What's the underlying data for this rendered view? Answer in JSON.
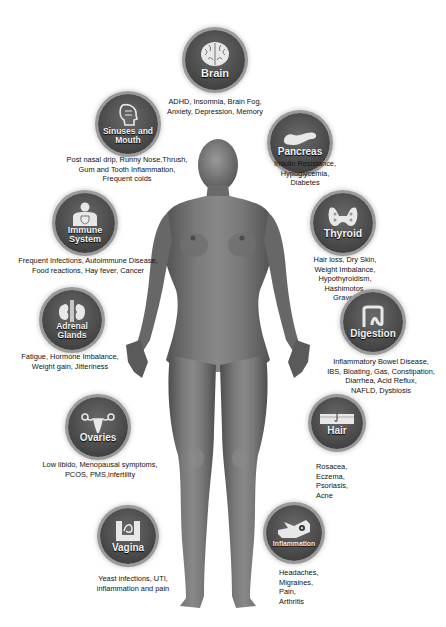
{
  "title": "",
  "colors": {
    "badge_fill": "#4a4a4a",
    "badge_ring": "#9a9a9a",
    "body_tone": "#6e6e6e",
    "text": "#111111",
    "background": "#ffffff"
  },
  "organs": [
    {
      "id": "brain",
      "label": "Brain",
      "icon": "brain-icon",
      "description": "ADHD, Insomnia, Brain Fog, Anxiety, Depression, Memory"
    },
    {
      "id": "sinuses",
      "label": "Sinuses and Mouth",
      "icon": "head-profile-icon",
      "description": "Post nasal drip, Runny Nose,Thrush, Gum and Tooth Inflammation, Frequent colds"
    },
    {
      "id": "pancreas",
      "label": "Pancreas",
      "icon": "pancreas-icon",
      "description": "Insulin Resistance, Hypoglycemia, Diabetes"
    },
    {
      "id": "immune",
      "label": "Immune System",
      "icon": "shield-torso-icon",
      "description": "Frequent Infections, Autoimmune Disease, Food reactions, Hay fever, Cancer"
    },
    {
      "id": "thyroid",
      "label": "Thyroid",
      "icon": "thyroid-icon",
      "description": "Hair loss, Dry Skin, Weight Imbalance, Hypothyroidism, Hashimotos, Graves"
    },
    {
      "id": "adrenal",
      "label": "Adrenal Glands",
      "icon": "kidneys-icon",
      "description": "Fatigue, Hormone Imbalance, Weight gain, Jitteriness"
    },
    {
      "id": "digestion",
      "label": "Digestion",
      "icon": "intestine-icon",
      "description": "Inflammatory Bowel Disease, IBS, Bloating, Gas, Constipation, Diarrhea, Acid Reflux, NAFLD, Dysbiosis"
    },
    {
      "id": "ovaries",
      "label": "Ovaries",
      "icon": "uterus-icon",
      "description": "Low libido, Menopausal symptoms, PCOS, PMS,infertility"
    },
    {
      "id": "hair",
      "label": "Hair",
      "icon": "hair-follicle-icon",
      "description": "Rosacea, Eczema, Psoriasis, Acne"
    },
    {
      "id": "vagina",
      "label": "Vagina",
      "icon": "pelvis-icon",
      "description": "Yeast infections, UTI, inflammation and pain"
    },
    {
      "id": "inflammation",
      "label": "Inflammation",
      "icon": "hand-inflammation-icon",
      "description": "Headaches, Migraines, Pain, Arthritis"
    }
  ],
  "desc_lines": {
    "brain": [
      "ADHD, Insomnia, Brain Fog,",
      "Anxiety, Depression, Memory"
    ],
    "sinuses": [
      "Post nasal drip, Runny Nose,Thrush,",
      "Gum and Tooth Inflammation,",
      "Frequent colds"
    ],
    "pancreas": [
      "Insulin Resistance,",
      "Hypoglycemia,",
      "Diabetes"
    ],
    "immune": [
      "Frequent Infections, Autoimmune Disease,",
      "Food reactions, Hay fever, Cancer"
    ],
    "thyroid": [
      "Hair loss, Dry Skin,",
      "Weight Imbalance,",
      "Hypothyroidism,",
      "Hashimotos,",
      "Graves"
    ],
    "adrenal": [
      "Fatigue, Hormone Imbalance,",
      "Weight gain, Jitteriness"
    ],
    "digestion": [
      "Inflammatory Bowel Disease,",
      "IBS, Bloating, Gas, Constipation,",
      "Diarrhea, Acid Reflux,",
      "NAFLD, Dysbiosis"
    ],
    "ovaries": [
      "Low libido, Menopausal symptoms,",
      "PCOS, PMS,infertility"
    ],
    "hair": [
      "Rosacea,",
      "Eczema,",
      "Psoriasis,",
      "Acne"
    ],
    "vagina": [
      "Yeast infections, UTI,",
      "inflammation and pain"
    ],
    "inflammation": [
      "Headaches,",
      "Migraines,",
      "Pain,",
      "Arthritis"
    ]
  },
  "label_lines": {
    "brain": [
      "Brain"
    ],
    "sinuses": [
      "Sinuses and",
      "Mouth"
    ],
    "pancreas": [
      "Pancreas"
    ],
    "immune": [
      "Immune",
      "System"
    ],
    "thyroid": [
      "Thyroid"
    ],
    "adrenal": [
      "Adrenal",
      "Glands"
    ],
    "digestion": [
      "Digestion"
    ],
    "ovaries": [
      "Ovaries"
    ],
    "hair": [
      "Hair"
    ],
    "vagina": [
      "Vagina"
    ],
    "inflammation": [
      "Inflammation"
    ]
  }
}
